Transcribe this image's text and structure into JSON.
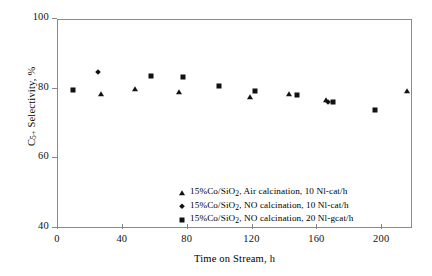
{
  "chart_data": {
    "type": "scatter",
    "title": "",
    "xlabel": "Time on Stream, h",
    "ylabel": "C5+ Selectivity, %",
    "ylabel_parts": {
      "prefix": "C",
      "sub": "5+",
      "suffix": " Selectivity, %"
    },
    "xlim": [
      0,
      219
    ],
    "ylim": [
      40,
      100
    ],
    "xticks": [
      0,
      40,
      80,
      120,
      160,
      200
    ],
    "yticks": [
      40,
      60,
      80,
      100
    ],
    "grid": false,
    "legend_position": "bottom-center-inside",
    "series": [
      {
        "name": "15%Co/SiO2, Air calcination, 10 Nl-cat/h",
        "label_parts": {
          "pre": "15%Co/SiO",
          "sub": "2",
          "post": ", Air calcination, 10 Nl-cat/h"
        },
        "marker": "triangle",
        "color": "#111111",
        "points": [
          {
            "x": 27,
            "y": 78.5
          },
          {
            "x": 48,
            "y": 79.8
          },
          {
            "x": 75,
            "y": 79.0
          },
          {
            "x": 119,
            "y": 77.5
          },
          {
            "x": 143,
            "y": 78.5
          },
          {
            "x": 166,
            "y": 76.7
          },
          {
            "x": 216,
            "y": 79.2
          }
        ]
      },
      {
        "name": "15%Co/SiO2, NO calcination, 10 Nl-cat/h",
        "label_parts": {
          "pre": "15%Co/SiO",
          "sub": "2",
          "post": ", NO calcination, 10 Nl-cat/h"
        },
        "marker": "diamond",
        "color": "#111111",
        "points": [
          {
            "x": 25,
            "y": 84.8
          },
          {
            "x": 167,
            "y": 76.2
          }
        ]
      },
      {
        "name": "15%Co/SiO2, NO calcination, 20 Nl-gcat/h",
        "label_parts": {
          "pre": "15%Co/SiO",
          "sub": "2",
          "post": ", NO calcination, 20 Nl-gcat/h"
        },
        "marker": "square",
        "color": "#111111",
        "points": [
          {
            "x": 10,
            "y": 79.6
          },
          {
            "x": 58,
            "y": 83.6
          },
          {
            "x": 78,
            "y": 83.3
          },
          {
            "x": 100,
            "y": 80.9
          },
          {
            "x": 122,
            "y": 79.2
          },
          {
            "x": 148,
            "y": 78.2
          },
          {
            "x": 170,
            "y": 76.2
          },
          {
            "x": 196,
            "y": 74.0
          }
        ]
      }
    ]
  }
}
